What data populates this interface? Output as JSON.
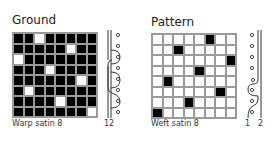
{
  "ground": {
    "title": "Ground",
    "caption": "Warp satin 8",
    "thread_label": "12",
    "cell_default": "black",
    "contrast_cells": [
      [
        0,
        2
      ],
      [
        1,
        5
      ],
      [
        2,
        0
      ],
      [
        3,
        3
      ],
      [
        4,
        6
      ],
      [
        5,
        1
      ],
      [
        6,
        4
      ],
      [
        7,
        7
      ]
    ]
  },
  "pattern": {
    "title": "Pattern",
    "caption": "Weft satin 8",
    "thread_labels": [
      "1",
      "2"
    ],
    "cell_default": "white",
    "contrast_cells": [
      [
        0,
        5
      ],
      [
        1,
        2
      ],
      [
        2,
        7
      ],
      [
        3,
        4
      ],
      [
        4,
        1
      ],
      [
        5,
        6
      ],
      [
        6,
        3
      ],
      [
        7,
        0
      ]
    ]
  },
  "colors": {
    "black": "#000000",
    "white": "#ffffff",
    "grid": "#9a9a9a"
  }
}
